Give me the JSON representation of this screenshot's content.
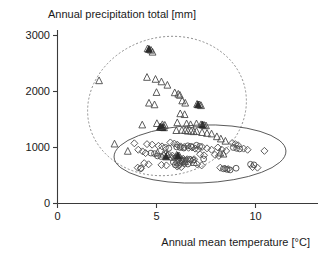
{
  "chart_data": {
    "type": "scatter",
    "title": "",
    "xlabel": "Annual mean temperature [°C]",
    "ylabel": "Annual precipitation total [mm]",
    "xlim": [
      -0.6,
      13.2
    ],
    "ylim": [
      -230,
      3250
    ],
    "xticks": [
      0,
      5,
      10
    ],
    "xticklabels": [
      "0",
      "5",
      "10"
    ],
    "yticks": [
      0,
      1000,
      2000,
      3000
    ],
    "yticklabels": [
      "0",
      "1000",
      "2000",
      "3000"
    ],
    "grid": false,
    "legend": "none",
    "series": [
      {
        "name": "triangles",
        "marker": "triangle-open",
        "points": [
          [
            4.55,
            2760
          ],
          [
            4.72,
            2735
          ],
          [
            4.8,
            2700
          ],
          [
            2.1,
            2190
          ],
          [
            4.52,
            2250
          ],
          [
            4.95,
            2215
          ],
          [
            5.25,
            2170
          ],
          [
            5.55,
            2110
          ],
          [
            5.0,
            1980
          ],
          [
            5.92,
            1975
          ],
          [
            6.1,
            1950
          ],
          [
            6.18,
            1930
          ],
          [
            4.62,
            1790
          ],
          [
            4.9,
            1760
          ],
          [
            6.3,
            1830
          ],
          [
            6.45,
            1790
          ],
          [
            7.05,
            1770
          ],
          [
            7.18,
            1760
          ],
          [
            7.25,
            1745
          ],
          [
            6.2,
            1600
          ],
          [
            6.42,
            1585
          ],
          [
            4.28,
            1400
          ],
          [
            5.02,
            1425
          ],
          [
            5.3,
            1405
          ],
          [
            5.42,
            1395
          ],
          [
            5.2,
            1360
          ],
          [
            5.28,
            1355
          ],
          [
            5.38,
            1350
          ],
          [
            6.05,
            1440
          ],
          [
            6.52,
            1420
          ],
          [
            6.72,
            1405
          ],
          [
            7.02,
            1420
          ],
          [
            7.25,
            1405
          ],
          [
            7.4,
            1395
          ],
          [
            7.5,
            1385
          ],
          [
            6.0,
            1300
          ],
          [
            6.28,
            1305
          ],
          [
            6.45,
            1300
          ],
          [
            6.58,
            1290
          ],
          [
            6.75,
            1290
          ],
          [
            6.88,
            1280
          ],
          [
            7.02,
            1285
          ],
          [
            7.3,
            1265
          ],
          [
            7.55,
            1250
          ],
          [
            7.78,
            1240
          ],
          [
            8.05,
            1190
          ],
          [
            8.25,
            1150
          ],
          [
            8.48,
            1110
          ],
          [
            5.05,
            900
          ],
          [
            5.35,
            880
          ],
          [
            5.55,
            870
          ],
          [
            6.02,
            860
          ],
          [
            6.15,
            845
          ],
          [
            8.22,
            900
          ],
          [
            8.38,
            880
          ],
          [
            2.88,
            1060
          ],
          [
            3.55,
            930
          ],
          [
            6.3,
            760
          ],
          [
            6.45,
            745
          ],
          [
            6.9,
            730
          ]
        ]
      },
      {
        "name": "diamonds",
        "marker": "diamond-open",
        "points": [
          [
            3.88,
            1075
          ],
          [
            4.52,
            1060
          ],
          [
            4.78,
            1050
          ],
          [
            4.08,
            960
          ],
          [
            4.3,
            930
          ],
          [
            4.45,
            900
          ],
          [
            5.1,
            1030
          ],
          [
            5.28,
            1020
          ],
          [
            5.7,
            1090
          ],
          [
            5.9,
            1070
          ],
          [
            6.05,
            1050
          ],
          [
            6.22,
            1020
          ],
          [
            6.4,
            1010
          ],
          [
            6.62,
            995
          ],
          [
            6.8,
            1000
          ],
          [
            6.95,
            980
          ],
          [
            7.1,
            970
          ],
          [
            7.3,
            1010
          ],
          [
            7.55,
            985
          ],
          [
            7.78,
            960
          ],
          [
            8.1,
            1000
          ],
          [
            8.3,
            960
          ],
          [
            8.52,
            940
          ],
          [
            8.82,
            1080
          ],
          [
            8.98,
            1060
          ],
          [
            9.12,
            1040
          ],
          [
            9.4,
            980
          ],
          [
            9.6,
            960
          ],
          [
            10.45,
            940
          ],
          [
            5.45,
            880
          ],
          [
            5.62,
            870
          ],
          [
            5.8,
            855
          ],
          [
            6.0,
            830
          ],
          [
            6.18,
            815
          ],
          [
            6.35,
            800
          ],
          [
            6.55,
            790
          ],
          [
            6.72,
            775
          ],
          [
            6.9,
            790
          ],
          [
            7.2,
            880
          ],
          [
            7.4,
            860
          ],
          [
            7.95,
            870
          ],
          [
            8.15,
            850
          ],
          [
            4.38,
            720
          ],
          [
            4.6,
            700
          ],
          [
            5.25,
            690
          ],
          [
            5.5,
            680
          ],
          [
            6.05,
            660
          ],
          [
            6.25,
            650
          ],
          [
            7.05,
            700
          ],
          [
            7.28,
            680
          ],
          [
            8.22,
            640
          ],
          [
            8.45,
            625
          ],
          [
            8.62,
            615
          ],
          [
            9.85,
            650
          ],
          [
            10.1,
            640
          ],
          [
            4.05,
            640
          ],
          [
            4.22,
            630
          ]
        ]
      },
      {
        "name": "circles",
        "marker": "circle-open",
        "points": [
          [
            4.72,
            900
          ],
          [
            4.9,
            890
          ],
          [
            5.45,
            1000
          ],
          [
            5.62,
            985
          ],
          [
            6.02,
            1010
          ],
          [
            6.2,
            1000
          ],
          [
            6.38,
            990
          ],
          [
            6.58,
            1030
          ],
          [
            6.75,
            1020
          ],
          [
            7.02,
            1040
          ],
          [
            7.18,
            1020
          ],
          [
            8.88,
            1000
          ],
          [
            9.05,
            985
          ],
          [
            9.2,
            975
          ],
          [
            5.05,
            850
          ],
          [
            5.22,
            840
          ],
          [
            5.75,
            820
          ],
          [
            5.92,
            810
          ],
          [
            6.12,
            790
          ],
          [
            6.3,
            780
          ],
          [
            6.48,
            770
          ],
          [
            6.68,
            790
          ],
          [
            6.85,
            775
          ],
          [
            7.38,
            795
          ],
          [
            9.75,
            700
          ],
          [
            9.92,
            690
          ],
          [
            8.38,
            620
          ],
          [
            8.55,
            610
          ],
          [
            8.72,
            600
          ],
          [
            9.02,
            630
          ],
          [
            4.2,
            625
          ],
          [
            5.85,
            740
          ],
          [
            6.02,
            730
          ],
          [
            6.2,
            720
          ],
          [
            6.4,
            715
          ],
          [
            6.58,
            705
          ],
          [
            5.95,
            690
          ],
          [
            6.12,
            680
          ]
        ]
      },
      {
        "name": "filled-triangles",
        "marker": "triangle-filled",
        "points": [
          [
            4.62,
            2750
          ],
          [
            5.18,
            1360
          ],
          [
            5.3,
            1355
          ],
          [
            7.1,
            1760
          ],
          [
            7.32,
            1400
          ],
          [
            6.08,
            850
          ],
          [
            5.48,
            830
          ]
        ]
      }
    ],
    "ellipses": [
      {
        "name": "upper-group-ellipse",
        "style": "dashed",
        "cx_px": 167,
        "cy_px": 106,
        "rx_px": 80,
        "ry_px": 69,
        "rotation_deg": -14
      },
      {
        "name": "lower-group-ellipse",
        "style": "solid",
        "cx_px": 200,
        "cy_px": 154,
        "rx_px": 86,
        "ry_px": 29,
        "rotation_deg": -2
      }
    ]
  },
  "axes": {
    "x_title": "Annual mean temperature [°C]",
    "y_title": "Annual precipitation total [mm]",
    "x_tick_0": "0",
    "x_tick_1": "5",
    "x_tick_2": "10",
    "y_tick_0": "0",
    "y_tick_1": "1000",
    "y_tick_2": "2000",
    "y_tick_3": "3000"
  },
  "colors": {
    "axis": "#3a3a3a",
    "marker": "#4a4a4a",
    "marker_filled": "#2b2b2b",
    "ellipse_dashed": "#8a8a8a",
    "ellipse_solid": "#4a4a4a",
    "background": "#ffffff"
  }
}
